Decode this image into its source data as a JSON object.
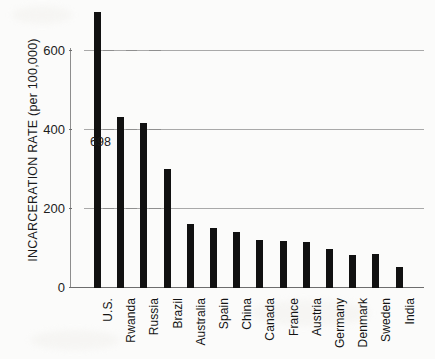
{
  "chart_data": {
    "type": "bar",
    "title": "",
    "xlabel": "",
    "ylabel": "INCARCERATION RATE (per 100,000)",
    "categories": [
      "U.S.",
      "Rwanda",
      "Russia",
      "Brazil",
      "Australia",
      "Spain",
      "China",
      "Canada",
      "France",
      "Austria",
      "Germany",
      "Denmark",
      "Sweden",
      "India"
    ],
    "values": [
      698,
      434,
      418,
      301,
      162,
      151,
      141,
      122,
      118,
      117,
      100,
      83,
      85,
      53
    ],
    "ylim": [
      0,
      700
    ],
    "yticks": [
      0,
      200,
      400,
      600
    ],
    "ytick_labels": [
      "0",
      "200",
      "400",
      "600"
    ],
    "gridlines": [
      200,
      400,
      600
    ],
    "grid": true,
    "legend": false,
    "annotations": [
      {
        "label": "698",
        "series_index": 0,
        "text": "698"
      }
    ]
  },
  "axis": {
    "y_label": "INCARCERATION RATE (per 100,000)",
    "tick_0": "0",
    "tick_200": "200",
    "tick_400": "400",
    "tick_600": "600"
  },
  "bars": [
    {
      "label": "U.S.",
      "value": 698
    },
    {
      "label": "Rwanda",
      "value": 434
    },
    {
      "label": "Russia",
      "value": 418
    },
    {
      "label": "Brazil",
      "value": 301
    },
    {
      "label": "Australia",
      "value": 162
    },
    {
      "label": "Spain",
      "value": 151
    },
    {
      "label": "China",
      "value": 141
    },
    {
      "label": "Canada",
      "value": 122
    },
    {
      "label": "France",
      "value": 118
    },
    {
      "label": "Austria",
      "value": 117
    },
    {
      "label": "Germany",
      "value": 100
    },
    {
      "label": "Denmark",
      "value": 83
    },
    {
      "label": "Sweden",
      "value": 85
    },
    {
      "label": "India",
      "value": 53
    }
  ],
  "annotation": {
    "us_value": "698"
  },
  "colors": {
    "bar": "#111111",
    "grid": "#9a9a9a",
    "axis": "#6d6d6d",
    "text": "#141414",
    "background": "#fbfbfa"
  }
}
